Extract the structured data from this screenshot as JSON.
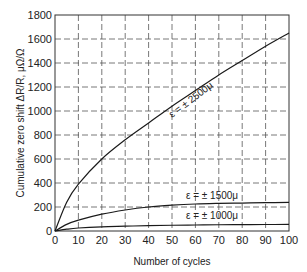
{
  "chart_data": {
    "type": "line",
    "title": "",
    "xlabel": "Number of cycles",
    "ylabel": "Cumulative zero shift ΔR/R, μΩ/Ω",
    "xlim": [
      0,
      100
    ],
    "ylim": [
      0,
      1800
    ],
    "x_ticks": [
      0,
      10,
      20,
      30,
      40,
      50,
      60,
      70,
      80,
      90,
      100
    ],
    "y_ticks": [
      0,
      200,
      400,
      600,
      800,
      1000,
      1200,
      1400,
      1600,
      1800
    ],
    "grid": true,
    "grid_style": "dashed",
    "legend": "none (curves labeled inline)",
    "x": [
      0,
      5,
      10,
      20,
      30,
      40,
      50,
      60,
      70,
      80,
      90,
      100
    ],
    "series": [
      {
        "name": "ε = ± 2500μ",
        "values": [
          0,
          240,
          390,
          600,
          760,
          900,
          1040,
          1170,
          1300,
          1420,
          1540,
          1650
        ]
      },
      {
        "name": "ε = ± 1500μ",
        "values": [
          0,
          55,
          90,
          140,
          175,
          200,
          215,
          225,
          230,
          233,
          236,
          238
        ]
      },
      {
        "name": "ε = ± 1000μ",
        "values": [
          0,
          15,
          25,
          35,
          40,
          45,
          48,
          50,
          52,
          53,
          54,
          55
        ]
      }
    ],
    "annotations": [
      {
        "text": "ε = ± 2500μ",
        "near_x": 47,
        "near_y": 1000,
        "rotated": true
      },
      {
        "text": "ε = ± 1500μ",
        "near_x": 58,
        "near_y": 290
      },
      {
        "text": "ε = ± 1000μ",
        "near_x": 58,
        "near_y": 130
      }
    ]
  },
  "labels": {
    "xlabel": "Number of cycles",
    "ylabel": "Cumulative zero shift ΔR/R, μΩ/Ω",
    "curve_2500": "ε = ± 2500μ",
    "curve_1500": "ε = ± 1500μ",
    "curve_1000": "ε = ± 1000μ"
  }
}
